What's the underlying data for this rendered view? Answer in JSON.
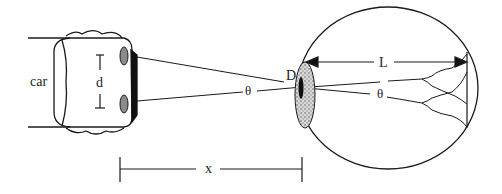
{
  "diagram": {
    "labels": {
      "car": "car",
      "headlight_separation": "d",
      "pupil_diameter": "D",
      "eye_length": "L",
      "angle_outside": "θ",
      "angle_inside": "θ",
      "distance": "x"
    },
    "components": [
      {
        "id": "car",
        "description": "Car front view with two headlights separated by distance d"
      },
      {
        "id": "eye",
        "description": "Cross-section of eyeball with pupil of diameter D and length L to retina"
      },
      {
        "id": "rays",
        "description": "Two rays from headlights crossing at the pupil forming angle θ"
      },
      {
        "id": "retina-images",
        "description": "Two diffraction blur profiles on the retina"
      },
      {
        "id": "distance-marker",
        "description": "Distance x from car to eye"
      }
    ],
    "colors": {
      "stroke": "#1a1a1a",
      "headlight_fill": "#8a8a8a",
      "lens_fill": "#bdbdbd",
      "background": "#ffffff"
    }
  }
}
